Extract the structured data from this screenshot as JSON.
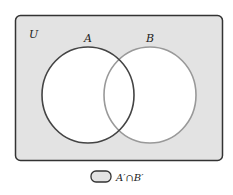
{
  "diagram": {
    "type": "venn",
    "universe_label": "U",
    "sets": [
      {
        "label": "A",
        "stroke": "#444444"
      },
      {
        "label": "B",
        "stroke": "#999999"
      }
    ],
    "shaded_region": "A'∩B'",
    "colors": {
      "shade": "#e3e3e3",
      "universe_border": "#333333",
      "circle_fill": "#ffffff"
    },
    "legend": {
      "label": "A′∩B′"
    }
  }
}
